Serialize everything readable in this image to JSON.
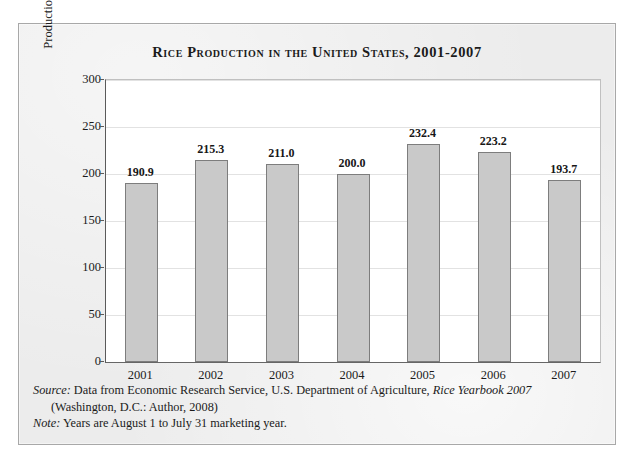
{
  "chart_data": {
    "type": "bar",
    "title": "Rice Production in the United States, 2001-2007",
    "xlabel": "",
    "ylabel": "Production (million hundredweights)",
    "categories": [
      "2001",
      "2002",
      "2003",
      "2004",
      "2005",
      "2006",
      "2007"
    ],
    "values": [
      190.9,
      215.3,
      211.0,
      200.0,
      232.4,
      223.2,
      193.7
    ],
    "value_labels": [
      "190.9",
      "215.3",
      "211.0",
      "200.0",
      "232.4",
      "223.2",
      "193.7"
    ],
    "ylim": [
      0,
      300
    ],
    "yticks": [
      0,
      50,
      100,
      150,
      200,
      250,
      300
    ],
    "ytick_labels": [
      "0",
      "50",
      "100",
      "150",
      "200",
      "250",
      "300"
    ],
    "grid": "horizontal",
    "legend": "none",
    "bar_color": "#c9c9c9",
    "bar_border_color": "#7d7d7d",
    "plot_background": "#ffffff",
    "figure_background": "#ececec",
    "gridline_color": "#e2e2e2",
    "text_color": "#1b1b1b"
  },
  "notes": {
    "source_prefix": "Source:",
    "source_text": " Data from Economic Research Service, U.S. Department of Agriculture, ",
    "source_italic_title": "Rice Yearbook 2007",
    "source_line2": "(Washington, D.C.: Author, 2008)",
    "note_prefix": "Note:",
    "note_text": " Years are August 1 to July 31 marketing year."
  }
}
